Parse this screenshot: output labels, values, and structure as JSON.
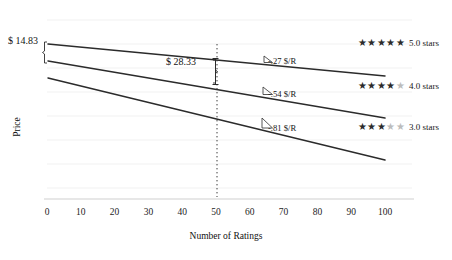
{
  "chart_data": {
    "type": "line",
    "title": "",
    "subtitle": "",
    "xlabel": "Number of Ratings",
    "ylabel": "Price",
    "xlim": [
      0,
      100
    ],
    "ylim": [
      0,
      100
    ],
    "xticks": [
      "0",
      "10",
      "20",
      "30",
      "40",
      "50",
      "60",
      "70",
      "80",
      "90",
      "100"
    ],
    "xtick_values": [
      0,
      10,
      20,
      30,
      40,
      50,
      60,
      70,
      80,
      90,
      100
    ],
    "yticks": [],
    "grid": "horizontal-faint",
    "legend_position": "right-inline",
    "series": [
      {
        "name": "5.0 stars",
        "slope_label": "-.27 $/R",
        "slope": -0.27,
        "stars_filled": 5,
        "stars_total": 5,
        "x": [
          0,
          100
        ],
        "y_price": [
          75.0,
          48.0
        ],
        "color": "#2b2b2b"
      },
      {
        "name": "4.0 stars",
        "slope_label": "-.54 $/R",
        "slope": -0.54,
        "stars_filled": 4,
        "stars_total": 5,
        "x": [
          0,
          100
        ],
        "y_price": [
          60.17,
          6.17
        ],
        "color": "#2b2b2b"
      },
      {
        "name": "3.0 stars",
        "slope_label": "-.81 $/R",
        "slope": -0.81,
        "stars_filled": 3,
        "stars_total": 5,
        "x": [
          0,
          100
        ],
        "y_price": [
          45.0,
          -36.0
        ],
        "color": "#2b2b2b"
      }
    ],
    "annotations": [
      {
        "name": "gap-at-zero",
        "label": "$ 14.83",
        "value": 14.83,
        "at_x": 0,
        "between": [
          "5.0 stars",
          "4.0 stars"
        ],
        "style": "left-brace"
      },
      {
        "label": "$ 28.33",
        "name": "gap-at-fifty",
        "value": 28.33,
        "at_x": 50,
        "between": [
          "5.0 stars",
          "4.0 stars"
        ],
        "style": "right-brace-with-dotted-guide"
      }
    ],
    "reference_line": {
      "name": "x-50-dotted",
      "x": 50,
      "style": "dotted",
      "color": "#3a3a3a"
    }
  },
  "axes": {
    "x_title": "Number of Ratings",
    "y_title": "Price",
    "tick_labels": [
      "0",
      "10",
      "20",
      "30",
      "40",
      "50",
      "60",
      "70",
      "80",
      "90",
      "100"
    ]
  },
  "annotations": {
    "gap_zero_label": "$ 14.83",
    "gap_fifty_label": "$ 28.33",
    "slope_5": "-.27 $/R",
    "slope_4": "-.54 $/R",
    "slope_3": "-.81 $/R"
  },
  "legend": {
    "items": [
      {
        "label": "5.0 stars",
        "filled": 5,
        "empty": 0
      },
      {
        "label": "4.0 stars",
        "filled": 4,
        "empty": 1
      },
      {
        "label": "3.0 stars",
        "filled": 3,
        "empty": 2
      }
    ]
  },
  "colors": {
    "line": "#2b2b2b",
    "grid": "#f0f0f0",
    "axis": "#2d2d2d",
    "star_on": "#2b2b2b",
    "star_off": "#bcbcbc",
    "text": "#141414"
  }
}
